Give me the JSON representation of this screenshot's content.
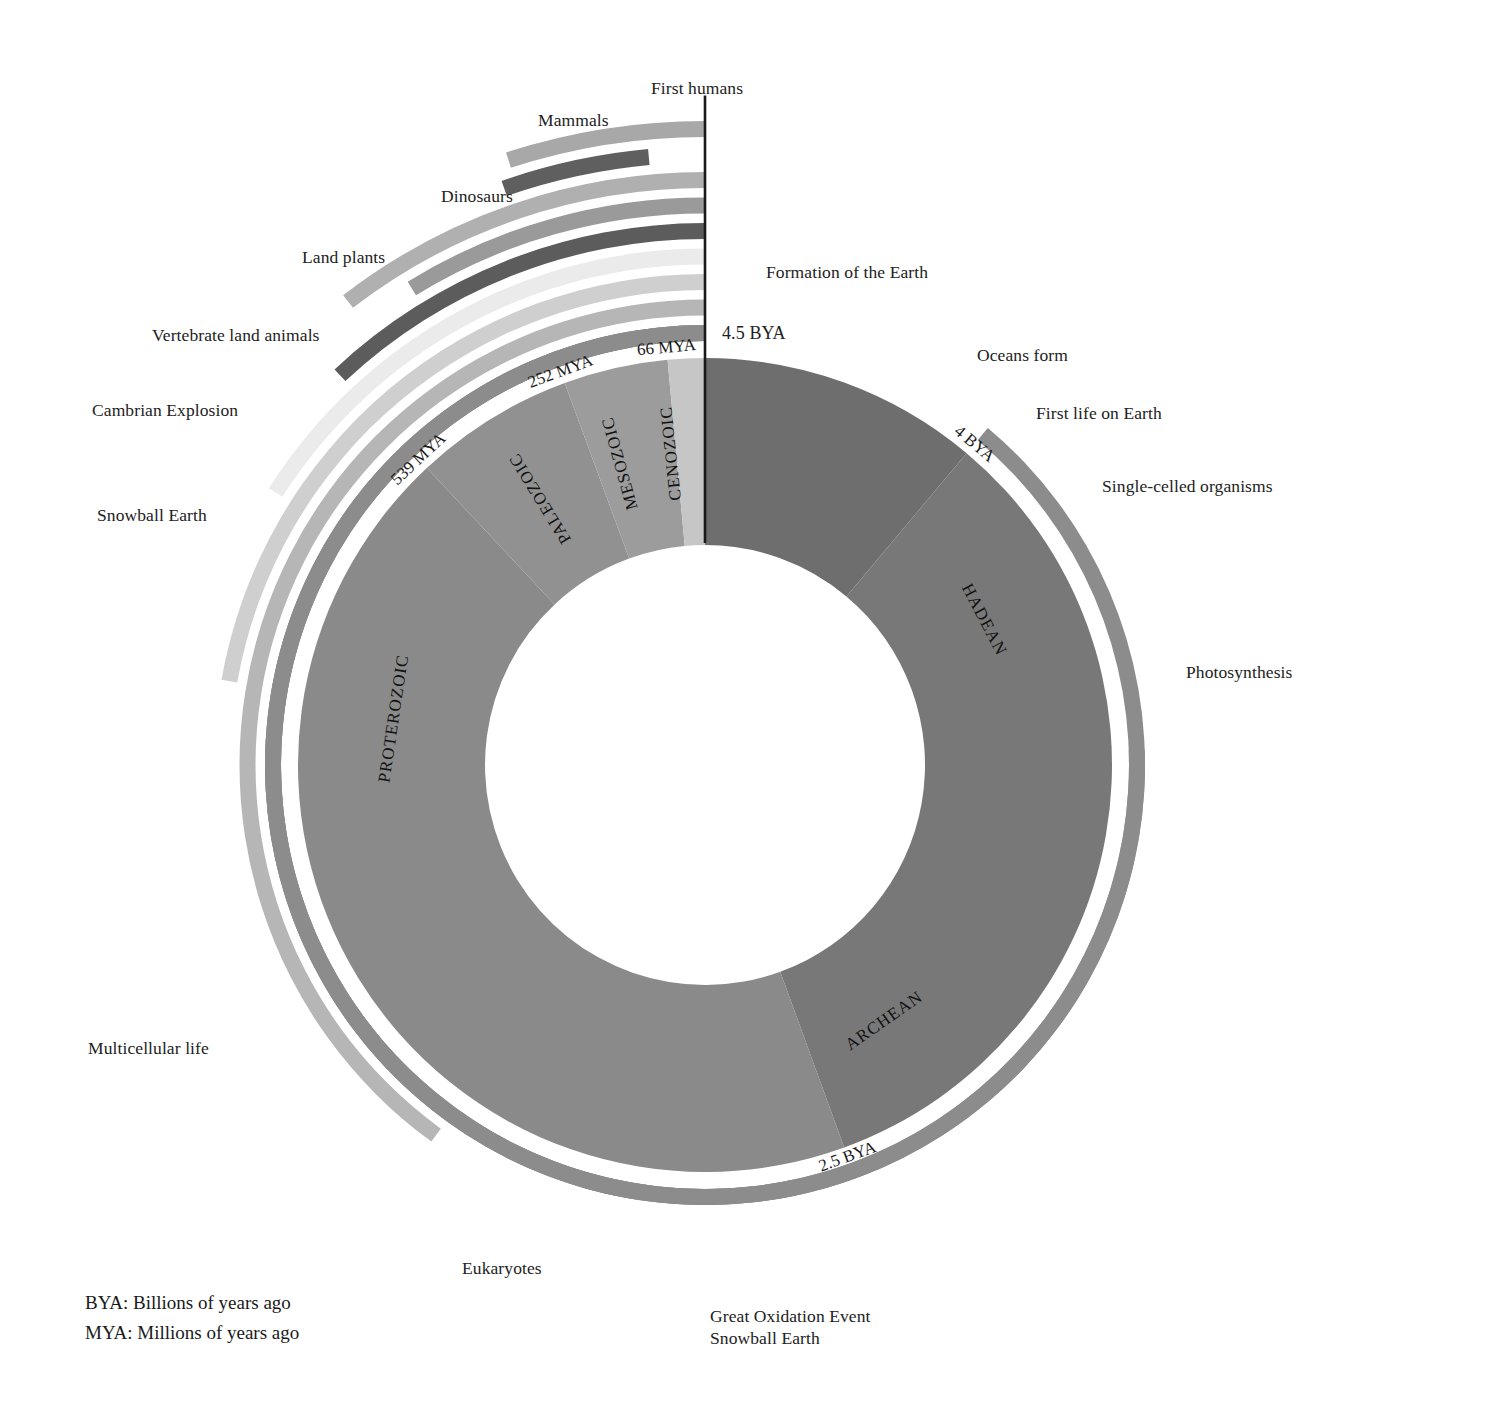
{
  "chart_data": {
    "type": "pie",
    "title": "",
    "subtitle": "",
    "variant": "donut-timeline",
    "center": {
      "x": 705,
      "y": 765
    },
    "radii": {
      "inner": 220,
      "outer": 407
    },
    "total_span_bya": 4.5,
    "direction": "clockwise from 12 o'clock (4.5 BYA) back to present",
    "categories": [
      "HADEAN",
      "ARCHEAN",
      "PROTEROZOIC",
      "PALEOZOIC",
      "MESOZOIC",
      "CENOZOIC"
    ],
    "values": [
      0.5,
      1.5,
      1.961,
      0.287,
      0.186,
      0.066
    ],
    "units": "billions of years",
    "legend_position": "bottom-left",
    "grid": false,
    "eons": [
      {
        "name": "HADEAN",
        "start_bya": 4.5,
        "end_bya": 4.0,
        "color": "#6e6e6e",
        "label_angle_deg": 62.5
      },
      {
        "name": "ARCHEAN",
        "start_bya": 4.0,
        "end_bya": 2.5,
        "color": "#787878",
        "label_angle_deg": 145.0
      },
      {
        "name": "PROTEROZOIC",
        "start_bya": 2.5,
        "end_bya": 0.539,
        "color": "#8a8a8a",
        "label_angle_deg": 278.5
      },
      {
        "name": "PALEOZOIC",
        "start_bya": 0.539,
        "end_bya": 0.252,
        "color": "#919191",
        "label_angle_deg": 328.5
      },
      {
        "name": "MESOZOIC",
        "start_bya": 0.252,
        "end_bya": 0.066,
        "color": "#9c9c9c",
        "label_angle_deg": 344.5
      },
      {
        "name": "CENOZOIC",
        "start_bya": 0.066,
        "end_bya": 0.0,
        "color": "#c6c6c6",
        "label_angle_deg": 354.0
      }
    ],
    "boundary_ticks": [
      {
        "text": "4.5 BYA",
        "bya": 4.5,
        "placement": "outside-top-right"
      },
      {
        "text": "4 BYA",
        "bya": 4.0,
        "placement": "rotated-arc"
      },
      {
        "text": "2.5 BYA",
        "bya": 2.5,
        "placement": "rotated-arc"
      },
      {
        "text": "539 MYA",
        "bya": 0.539,
        "placement": "rotated-arc"
      },
      {
        "text": "252 MYA",
        "bya": 0.252,
        "placement": "rotated-arc"
      },
      {
        "text": "66 MYA",
        "bya": 0.066,
        "placement": "rotated-arc"
      }
    ],
    "events": [
      {
        "label": "Single-celled organisms",
        "start_bya": 4.0,
        "end_bya": 0.0,
        "ring": 1,
        "color": "#8c8c8c",
        "label_side": "right"
      },
      {
        "label": "Photosynthesis",
        "start_bya": 3.4,
        "end_bya": 0.0,
        "ring": 1,
        "color": "#8c8c8c",
        "label_side": "right"
      },
      {
        "label": "Great Oxidation Event",
        "start_bya": 2.4,
        "end_bya": 0.0,
        "ring": 1,
        "color": "#8c8c8c",
        "label_side": "bottom"
      },
      {
        "label": "Eukaryotes",
        "start_bya": 1.8,
        "end_bya": 0.0,
        "ring": 2,
        "color": "#b6b6b6",
        "label_side": "bottom-left"
      },
      {
        "label": "Multicellular life",
        "start_bya": 1.0,
        "end_bya": 0.0,
        "ring": 3,
        "color": "#cfcfcf",
        "label_side": "left"
      },
      {
        "label": "Snowball Earth",
        "start_bya": 0.72,
        "end_bya": 0.0,
        "ring": 4,
        "color": "#ebebeb",
        "label_side": "left"
      },
      {
        "label": "Cambrian Explosion",
        "start_bya": 0.539,
        "end_bya": 0.0,
        "ring": 5,
        "color": "#5c5c5c",
        "label_side": "left"
      },
      {
        "label": "Vertebrate land animals",
        "start_bya": 0.395,
        "end_bya": 0.0,
        "ring": 6,
        "color": "#9a9a9a",
        "label_side": "left"
      },
      {
        "label": "Land plants",
        "start_bya": 0.47,
        "end_bya": 0.0,
        "ring": 7,
        "color": "#b0b0b0",
        "label_side": "left"
      },
      {
        "label": "Dinosaurs",
        "start_bya": 0.24,
        "end_bya": 0.066,
        "ring": 8,
        "color": "#5f5f5f",
        "label_side": "left"
      },
      {
        "label": "Mammals",
        "start_bya": 0.225,
        "end_bya": 0.0,
        "ring": 9,
        "color": "#a8a8a8",
        "label_side": "left"
      },
      {
        "label": "First humans",
        "start_bya": 0.0,
        "end_bya": 0.0,
        "ring": 10,
        "color": "#1a1a1a",
        "label_side": "top",
        "marker": "tick"
      }
    ]
  },
  "callouts": {
    "first_humans": "First humans",
    "mammals": "Mammals",
    "dinosaurs": "Dinosaurs",
    "land_plants": "Land plants",
    "vertebrate_land_animals": "Vertebrate land animals",
    "cambrian_explosion": "Cambrian Explosion",
    "snowball_earth_left": "Snowball Earth",
    "multicellular_life": "Multicellular life",
    "eukaryotes": "Eukaryotes",
    "great_oxidation_event": "Great Oxidation Event",
    "snowball_earth_bottom": "Snowball Earth",
    "formation_of_the_earth": "Formation of the Earth",
    "oceans_form": "Oceans form",
    "first_life_on_earth": "First life on Earth",
    "single_celled_organisms": "Single-celled organisms",
    "photosynthesis": "Photosynthesis"
  },
  "tick_labels": {
    "t45bya": "4.5 BYA",
    "t4bya": "4 BYA",
    "t25bya": "2.5 BYA",
    "t539mya": "539 MYA",
    "t252mya": "252 MYA",
    "t66mya": "66 MYA"
  },
  "eon_labels": {
    "hadean": "HADEAN",
    "archean": "ARCHEAN",
    "proterozoic": "PROTEROZOIC",
    "paleozoic": "PALEOZOIC",
    "mesozoic": "MESOZOIC",
    "cenozoic": "CENOZOIC"
  },
  "legend": {
    "bya": "BYA: Billions of years ago",
    "mya": "MYA: Millions of years ago"
  }
}
